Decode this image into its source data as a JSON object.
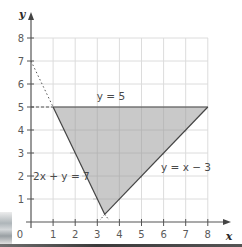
{
  "figure": {
    "type": "linear-inequality-region-graph",
    "axes": {
      "x_label": "x",
      "y_label": "y",
      "origin_label": "0",
      "x_ticks": [
        "1",
        "2",
        "3",
        "4",
        "5",
        "6",
        "7",
        "8"
      ],
      "y_ticks": [
        "1",
        "2",
        "3",
        "4",
        "5",
        "6",
        "7",
        "8"
      ],
      "x_range": [
        0,
        8
      ],
      "y_range": [
        0,
        8
      ]
    },
    "lines": [
      {
        "id": "y5",
        "equation": "y = 5",
        "style": "solid"
      },
      {
        "id": "yx3",
        "equation": "y = x − 3",
        "style": "solid"
      },
      {
        "id": "twoxy7",
        "equation": "2x + y = 7",
        "style": "solid-with-dotted-extension"
      }
    ],
    "labels": {
      "y5": "y = 5",
      "yx3": "y = x − 3",
      "twoxy7": "2x + y = 7"
    },
    "shaded_region": {
      "vertices": [
        [
          1,
          5
        ],
        [
          8,
          5
        ],
        [
          3.333,
          0.333
        ]
      ],
      "fill": "#c8c8c8"
    },
    "guides": [
      {
        "from": [
          0,
          5
        ],
        "to": [
          1,
          5
        ],
        "style": "dashed"
      },
      {
        "from": [
          0,
          7
        ],
        "to": [
          1,
          5
        ],
        "style": "dotted"
      }
    ],
    "colors": {
      "grid": "#d9d9d9",
      "axis": "#555555",
      "line": "#444444",
      "region": "#c8c8c8"
    }
  }
}
